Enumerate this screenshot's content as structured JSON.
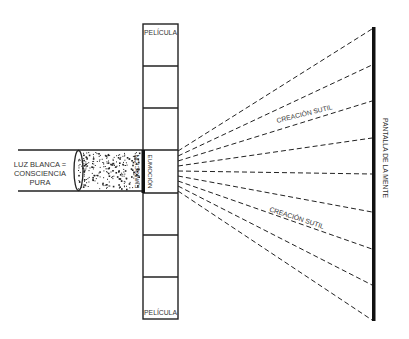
{
  "diagram": {
    "type": "optical-projection-metaphor",
    "colors": {
      "line": "#222222",
      "text": "#333333",
      "background": "#ffffff",
      "screen": "#111111"
    },
    "source": {
      "label_lines": [
        "LUZ BLANCA =",
        "CONSCIENCIA",
        "PURA"
      ]
    },
    "lens": {
      "name": "lens"
    },
    "beam": {
      "name": "speckled-light-beam"
    },
    "film": {
      "top_label": "PELÍCULA",
      "bottom_label": "PELÍCULA",
      "frames": 7,
      "active_frame_label": "EUMOCIÓN"
    },
    "rays": {
      "count": 9,
      "upper_label": "CREACIÓN SUTIL",
      "lower_label": "CREACIÓN SUTIL"
    },
    "screen": {
      "label": "PANTALLA DE LA MENTE"
    }
  }
}
